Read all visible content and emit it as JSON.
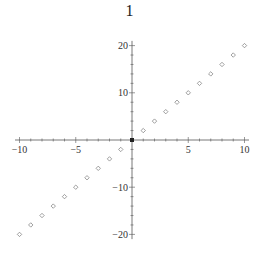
{
  "title": "1",
  "chart_data": {
    "type": "scatter",
    "title": "1",
    "xlabel": "",
    "ylabel": "",
    "xlim": [
      -10.5,
      10.5
    ],
    "ylim": [
      -21,
      21
    ],
    "xticks": [
      -10,
      -5,
      5,
      10
    ],
    "yticks": [
      -20,
      -10,
      10,
      20
    ],
    "grid": false,
    "legend": null,
    "marker": "hollow-diamond",
    "series": [
      {
        "name": "y = 2x",
        "x": [
          -10,
          -9,
          -8,
          -7,
          -6,
          -5,
          -4,
          -3,
          -2,
          -1,
          0,
          1,
          2,
          3,
          4,
          5,
          6,
          7,
          8,
          9,
          10
        ],
        "y": [
          -20,
          -18,
          -16,
          -14,
          -12,
          -10,
          -8,
          -6,
          -4,
          -2,
          0,
          2,
          4,
          6,
          8,
          10,
          12,
          14,
          16,
          18,
          20
        ]
      }
    ],
    "colors": {
      "axis": "#555555",
      "marker": "#777777",
      "origin": "#222222"
    }
  }
}
